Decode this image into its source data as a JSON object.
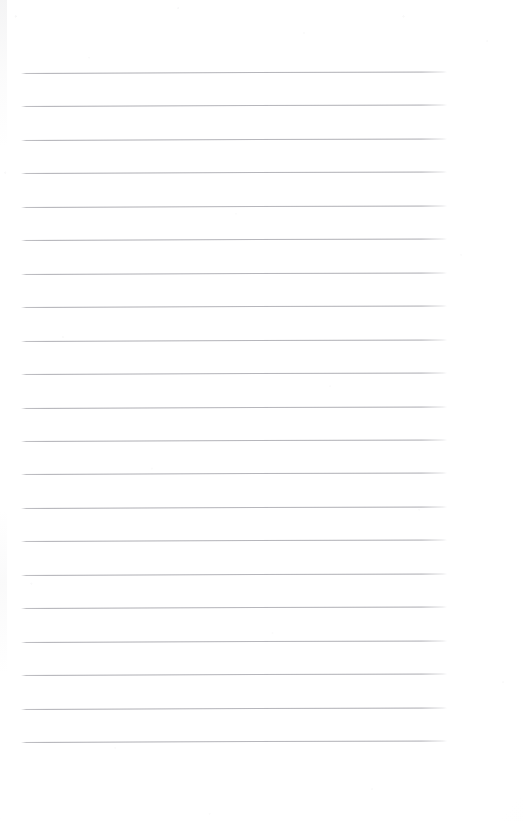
{
  "document": {
    "kind": "scanned-lined-paper",
    "title": "Lined Notebook Paper",
    "page_width": 524,
    "page_height": 822,
    "background_color": "#fefefe",
    "content_text": "",
    "has_handwriting": false,
    "has_printed_text": false
  },
  "ruling": {
    "line_count": 21,
    "line_color": "#aaaab0",
    "line_thickness_px": 1,
    "line_spacing_px": 33.4,
    "first_line_y": 73,
    "last_line_y": 744,
    "left_margin_x": 21,
    "right_margin_x": 447,
    "line_length_px": 426,
    "skew_rise_px": -1.6,
    "top_blank_margin_px": 73,
    "bottom_blank_margin_px": 78
  },
  "lines": [
    {
      "index": 1,
      "y": 73.0,
      "label": "rule-line-1"
    },
    {
      "index": 2,
      "y": 106.4,
      "label": "rule-line-2"
    },
    {
      "index": 3,
      "y": 139.9,
      "label": "rule-line-3"
    },
    {
      "index": 4,
      "y": 173.3,
      "label": "rule-line-4"
    },
    {
      "index": 5,
      "y": 206.8,
      "label": "rule-line-5"
    },
    {
      "index": 6,
      "y": 240.2,
      "label": "rule-line-6"
    },
    {
      "index": 7,
      "y": 273.7,
      "label": "rule-line-7"
    },
    {
      "index": 8,
      "y": 307.1,
      "label": "rule-line-8"
    },
    {
      "index": 9,
      "y": 340.6,
      "label": "rule-line-9"
    },
    {
      "index": 10,
      "y": 374.0,
      "label": "rule-line-10"
    },
    {
      "index": 11,
      "y": 407.5,
      "label": "rule-line-11"
    },
    {
      "index": 12,
      "y": 440.9,
      "label": "rule-line-12"
    },
    {
      "index": 13,
      "y": 474.4,
      "label": "rule-line-13"
    },
    {
      "index": 14,
      "y": 507.8,
      "label": "rule-line-14"
    },
    {
      "index": 15,
      "y": 541.3,
      "label": "rule-line-15"
    },
    {
      "index": 16,
      "y": 574.7,
      "label": "rule-line-16"
    },
    {
      "index": 17,
      "y": 608.2,
      "label": "rule-line-17"
    },
    {
      "index": 18,
      "y": 641.6,
      "label": "rule-line-18"
    },
    {
      "index": 19,
      "y": 675.1,
      "label": "rule-line-19"
    },
    {
      "index": 20,
      "y": 708.5,
      "label": "rule-line-20"
    },
    {
      "index": 21,
      "y": 742.0,
      "label": "rule-line-21"
    }
  ]
}
